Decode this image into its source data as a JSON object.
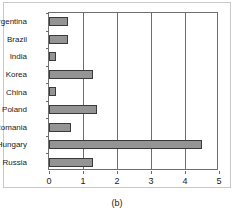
{
  "caption": "(b)",
  "chart_data": {
    "type": "bar",
    "orientation": "horizontal",
    "title": "",
    "xlabel": "",
    "ylabel": "",
    "categories": [
      "Argentina",
      "Brazil",
      "India",
      "Korea",
      "China",
      "Poland",
      "Romania",
      "Hungary",
      "Russia"
    ],
    "values": [
      0.55,
      0.55,
      0.2,
      1.3,
      0.2,
      1.4,
      0.65,
      4.5,
      1.3
    ],
    "xlim": [
      0,
      5
    ],
    "xticks": [
      0,
      1,
      2,
      3,
      4,
      5
    ],
    "xticklabels": [
      "0",
      "1",
      "2",
      "3",
      "4",
      "5"
    ],
    "grid": "vertical",
    "legend": null,
    "bar_color": "#949494",
    "bar_edge_color": "#3a3a3a",
    "axis_color": "#6e6e6e",
    "frame_color": "#c9c9c9"
  }
}
